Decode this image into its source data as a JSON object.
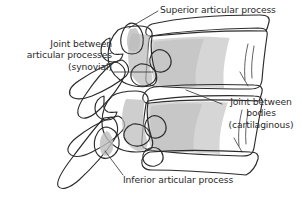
{
  "figure": {
    "background_color": "#ffffff",
    "ink_color": "#2b2b2b",
    "fills": {
      "bone_light": "#e9e9e9",
      "bone_mid": "#cfcfcf",
      "bone_dark": "#b4b4b4",
      "bone_shadow": "#a3a3a3",
      "disc_white": "#ffffff"
    }
  },
  "labels": {
    "superior_articular_process": "Superior articular process",
    "joint_articular_processes_line1": "Joint between",
    "joint_articular_processes_line2": "articular processes",
    "joint_articular_processes_line3": "(synovial)",
    "joint_bodies_line1": "Joint between",
    "joint_bodies_line2": "bodies",
    "joint_bodies_line3": "(cartilaginous)",
    "inferior_articular_process": "Inferior articular process"
  },
  "leader_lines": [
    {
      "name": "leader-superior-articular-process",
      "from": [
        158,
        11
      ],
      "to": [
        128,
        28
      ]
    },
    {
      "name": "leader-joint-articular-processes",
      "from": [
        115,
        72
      ],
      "to": [
        152,
        72
      ]
    },
    {
      "name": "leader-joint-bodies",
      "from": [
        221,
        104
      ],
      "to": [
        186,
        90
      ]
    },
    {
      "name": "leader-inferior-articular-process",
      "from": [
        122,
        176
      ],
      "to": [
        104,
        152
      ]
    }
  ],
  "structures": [
    {
      "name": "superior-vertebra-body",
      "fill": "bone_light"
    },
    {
      "name": "inferior-vertebra-body",
      "fill": "bone_light"
    },
    {
      "name": "intervertebral-disc-upper",
      "fill": "disc_white"
    },
    {
      "name": "intervertebral-disc-lower",
      "fill": "disc_white"
    },
    {
      "name": "superior-articular-process",
      "fill": "bone_mid"
    },
    {
      "name": "inferior-articular-process",
      "fill": "bone_mid"
    },
    {
      "name": "transverse-process-upper",
      "fill": "bone_dark"
    },
    {
      "name": "transverse-process-lower",
      "fill": "bone_dark"
    },
    {
      "name": "spinous-process-upper",
      "fill": "bone_dark"
    },
    {
      "name": "spinous-process-lower",
      "fill": "bone_dark"
    },
    {
      "name": "vertebral-arch-upper",
      "fill": "bone_mid"
    },
    {
      "name": "vertebral-arch-lower",
      "fill": "bone_mid"
    },
    {
      "name": "intervertebral-foramen-upper",
      "fill": "disc_white"
    },
    {
      "name": "intervertebral-foramen-lower",
      "fill": "disc_white"
    }
  ]
}
